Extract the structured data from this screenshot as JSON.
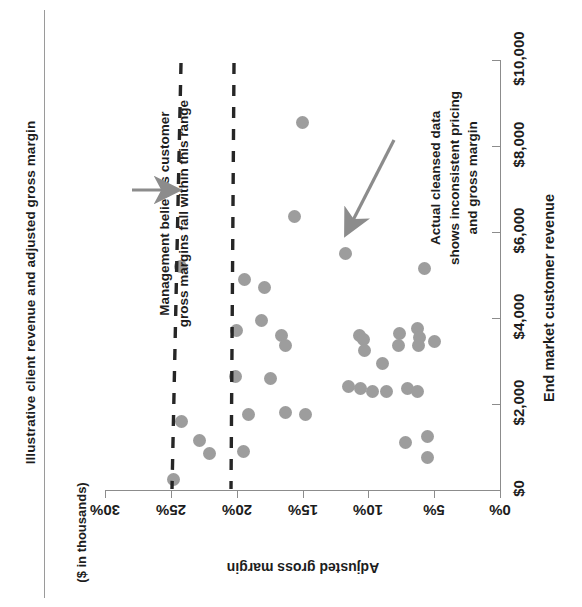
{
  "title": "Illustrative client revenue and adjusted gross margin",
  "units_caption": "($ in thousands)",
  "annotations": {
    "left": "Management believes customer\ngross margins fall within this range",
    "right": "Actual cleansed data\nshows inconsistent pricing\nand gross margin"
  },
  "axes": {
    "margin_axis_label": "Adjusted gross margin",
    "revenue_axis_label": "End market customer revenue",
    "margin_ticks": [
      "30%",
      "25%",
      "20%",
      "15%",
      "10%",
      "5%",
      "0%"
    ],
    "revenue_ticks": [
      "$0",
      "$2,000",
      "$4,000",
      "$6,000",
      "$8,000",
      "$10,000"
    ]
  },
  "colors": {
    "dot": "#9d9d9d",
    "axis": "#8c8c8c",
    "dash": "#262626",
    "arrow": "#8c8c8c",
    "text": "#1d1d1d"
  },
  "chart_data": {
    "type": "scatter",
    "title": "Illustrative client revenue and adjusted gross margin",
    "subtitle": "($ in thousands)",
    "xlabel": "Adjusted gross margin",
    "ylabel": "End market customer revenue",
    "orientation": "rotated-90-ccw",
    "xlim": [
      0,
      30
    ],
    "ylim": [
      0,
      10000
    ],
    "xticks": [
      0,
      5,
      10,
      15,
      20,
      25,
      30
    ],
    "xticklabels": [
      "0%",
      "5%",
      "10%",
      "15%",
      "20%",
      "25%",
      "30%"
    ],
    "yticks": [
      0,
      2000,
      4000,
      6000,
      8000,
      10000
    ],
    "yticklabels": [
      "$0",
      "$2,000",
      "$4,000",
      "$6,000",
      "$8,000",
      "$10,000"
    ],
    "grid": false,
    "legend": null,
    "x_unit": "percent adjusted gross margin",
    "y_unit": "thousands of dollars",
    "reference_lines": [
      {
        "name": "upper range bound",
        "x": 24.1,
        "style": "dashed",
        "orientation": "constant-margin"
      },
      {
        "name": "lower range bound",
        "x": 20.2,
        "style": "dashed",
        "orientation": "constant-margin"
      }
    ],
    "annotations": [
      {
        "text": "Management believes customer gross margins fall within this range",
        "points_to_x": 24.1,
        "points_to_y": 7900
      },
      {
        "text": "Actual cleansed data shows inconsistent pricing and gross margin",
        "points_to_x": 13.0,
        "points_to_y": 5000
      }
    ],
    "points": [
      {
        "x": 15.0,
        "y": 8550
      },
      {
        "x": 15.6,
        "y": 6350
      },
      {
        "x": 11.7,
        "y": 5500
      },
      {
        "x": 24.3,
        "y": 5200
      },
      {
        "x": 5.7,
        "y": 5150
      },
      {
        "x": 19.4,
        "y": 4900
      },
      {
        "x": 17.9,
        "y": 4700
      },
      {
        "x": 18.1,
        "y": 3950
      },
      {
        "x": 20.0,
        "y": 3700
      },
      {
        "x": 16.6,
        "y": 3600
      },
      {
        "x": 16.3,
        "y": 3350
      },
      {
        "x": 10.7,
        "y": 3600
      },
      {
        "x": 10.4,
        "y": 3500
      },
      {
        "x": 10.3,
        "y": 3250
      },
      {
        "x": 7.6,
        "y": 3650
      },
      {
        "x": 7.7,
        "y": 3350
      },
      {
        "x": 6.3,
        "y": 3750
      },
      {
        "x": 6.1,
        "y": 3550
      },
      {
        "x": 6.2,
        "y": 3350
      },
      {
        "x": 5.0,
        "y": 3450
      },
      {
        "x": 8.9,
        "y": 2950
      },
      {
        "x": 11.5,
        "y": 2400
      },
      {
        "x": 10.6,
        "y": 2350
      },
      {
        "x": 9.7,
        "y": 2300
      },
      {
        "x": 8.6,
        "y": 2300
      },
      {
        "x": 7.0,
        "y": 2350
      },
      {
        "x": 6.3,
        "y": 2300
      },
      {
        "x": 20.1,
        "y": 2650
      },
      {
        "x": 17.4,
        "y": 2600
      },
      {
        "x": 19.1,
        "y": 1750
      },
      {
        "x": 16.3,
        "y": 1800
      },
      {
        "x": 14.8,
        "y": 1750
      },
      {
        "x": 24.2,
        "y": 1600
      },
      {
        "x": 22.8,
        "y": 1150
      },
      {
        "x": 22.1,
        "y": 850
      },
      {
        "x": 19.5,
        "y": 900
      },
      {
        "x": 7.2,
        "y": 1100
      },
      {
        "x": 5.5,
        "y": 1250
      },
      {
        "x": 5.5,
        "y": 750
      },
      {
        "x": 24.8,
        "y": 250
      }
    ]
  }
}
